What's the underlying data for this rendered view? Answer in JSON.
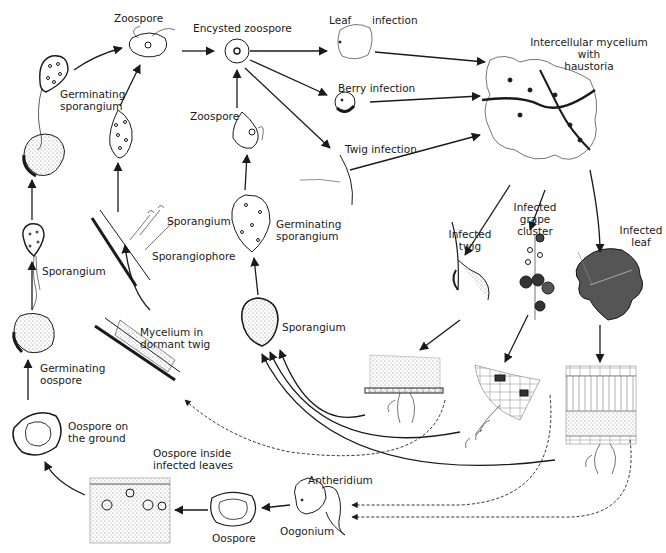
{
  "diagram": {
    "labels": {
      "zoospore_top": "Zoospore",
      "encysted_zoospore": "Encysted zoospore",
      "leaf_infection_1": "Leaf",
      "leaf_infection_2": "infection",
      "berry_infection": "Berry infection",
      "twig_infection": "Twig infection",
      "intercellular_1": "Intercellular mycelium",
      "intercellular_2": "with",
      "intercellular_3": "haustoria",
      "germinating_sporangium_left_1": "Germinating",
      "germinating_sporangium_left_2": "sporangium",
      "zoospore_mid": "Zoospore",
      "germinating_sporangium_mid_1": "Germinating",
      "germinating_sporangium_mid_2": "sporangium",
      "sporangium_mid": "Sporangium",
      "sporangium_left": "Sporangium",
      "sporangium_branch": "Sporangium",
      "sporangiophore": "Sporangiophore",
      "mycelium_dormant_1": "Mycelium in",
      "mycelium_dormant_2": "dormant twig",
      "germinating_oospore_1": "Germinating",
      "germinating_oospore_2": "oospore",
      "oospore_ground_1": "Oospore on",
      "oospore_ground_2": "the ground",
      "oospore_inside_1": "Oospore inside",
      "oospore_inside_2": "infected leaves",
      "oospore": "Oospore",
      "antheridium": "Antheridium",
      "oogonium": "Oogonium",
      "infected_twig_1": "Infected",
      "infected_twig_2": "twig",
      "infected_grape_1": "Infected",
      "infected_grape_2": "grape",
      "infected_grape_3": "cluster",
      "infected_leaf_1": "Infected",
      "infected_leaf_2": "leaf"
    },
    "colors": {
      "ink": "#1a1a1a",
      "background": "#ffffff"
    }
  }
}
